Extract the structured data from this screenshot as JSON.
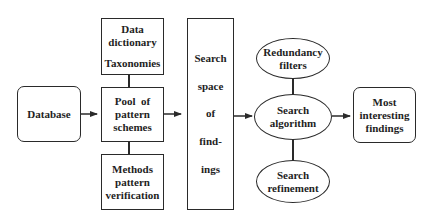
{
  "diagram": {
    "nodes": {
      "database": {
        "label": "Database"
      },
      "data_dictionary": {
        "line1": "Data",
        "line2": "dictionary",
        "line3": "Taxonomies"
      },
      "pool": {
        "line1": "Pool  of",
        "line2": "pattern",
        "line3": "schemes"
      },
      "methods": {
        "line1": "Methods",
        "line2": "pattern",
        "line3": "verification"
      },
      "search_space": {
        "line1": "Search",
        "line2": "space",
        "line3": "of",
        "line4": "find-",
        "line5": "ings"
      },
      "redundancy": {
        "line1": "Redundancy",
        "line2": "filters"
      },
      "search_algorithm": {
        "line1": "Search",
        "line2": "algorithm"
      },
      "search_refinement": {
        "line1": "Search",
        "line2": "refinement"
      },
      "findings": {
        "line1": "Most",
        "line2": "interesting",
        "line3": "findings"
      }
    },
    "edges": [
      {
        "from": "database",
        "to": "pool",
        "type": "arrow"
      },
      {
        "from": "data_dictionary",
        "to": "pool",
        "type": "line"
      },
      {
        "from": "pool",
        "to": "methods",
        "type": "line"
      },
      {
        "from": "pool",
        "to": "search_space",
        "type": "arrow"
      },
      {
        "from": "search_space",
        "to": "search_algorithm",
        "type": "arrow"
      },
      {
        "from": "redundancy",
        "to": "search_algorithm",
        "type": "line"
      },
      {
        "from": "search_algorithm",
        "to": "search_refinement",
        "type": "line"
      },
      {
        "from": "search_algorithm",
        "to": "findings",
        "type": "arrow"
      }
    ],
    "colors": {
      "stroke": "#2a2a2a",
      "text": "#1e1e1e",
      "background": "#ffffff"
    }
  }
}
